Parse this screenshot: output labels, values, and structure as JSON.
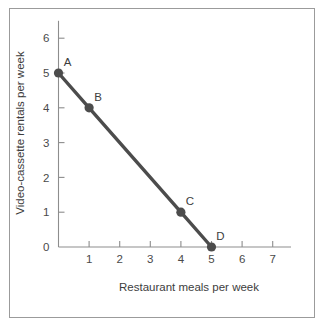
{
  "chart_data": {
    "type": "line",
    "title": "",
    "subtitle": "",
    "xlabel": "Restaurant meals per week",
    "ylabel": "Video-cassette rentals per week",
    "xlim": [
      0,
      7.6
    ],
    "ylim": [
      0,
      6.5
    ],
    "xticks": [
      1,
      2,
      3,
      4,
      5,
      6,
      7
    ],
    "xticklabels": [
      "1",
      "2",
      "3",
      "4",
      "5",
      "6",
      "7"
    ],
    "yticks": [
      0,
      1,
      2,
      3,
      4,
      5,
      6
    ],
    "yticklabels": [
      "0",
      "1",
      "2",
      "3",
      "4",
      "5",
      "6"
    ],
    "grid": false,
    "legend": "none",
    "line_color": "#4c4c4c",
    "marker_color": "#4c4c4c",
    "axis_color": "#8d8d8d",
    "frame_color": "#9b9b9b",
    "background_color": "#ffffff",
    "series": [
      {
        "name": "Consumption possibilities",
        "x": [
          0,
          1,
          4,
          5
        ],
        "y": [
          5,
          4,
          1,
          0
        ],
        "point_labels": [
          "A",
          "B",
          "C",
          "D"
        ]
      }
    ],
    "points": [
      {
        "label": "A",
        "x": 0,
        "y": 5
      },
      {
        "label": "B",
        "x": 1,
        "y": 4
      },
      {
        "label": "C",
        "x": 4,
        "y": 1
      },
      {
        "label": "D",
        "x": 5,
        "y": 0
      }
    ]
  }
}
